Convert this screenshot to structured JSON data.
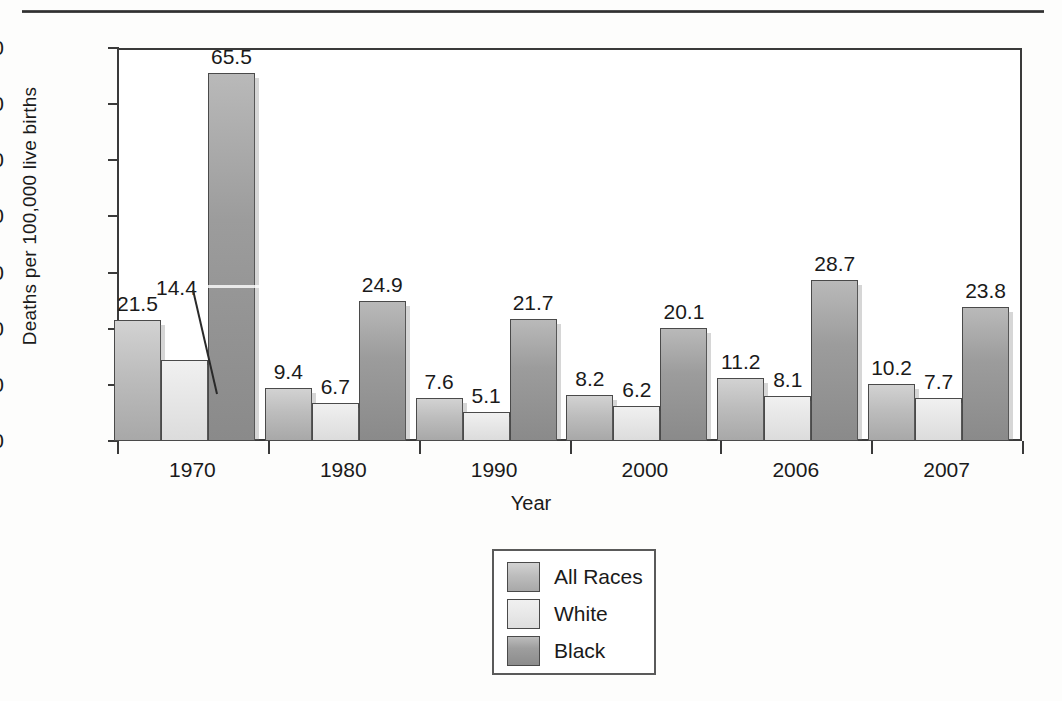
{
  "figure": {
    "top_rule": true,
    "axes": {
      "ylabel": "Deaths per 100,000 live births",
      "xlabel": "Year",
      "yticks": [
        "0",
        "10",
        "20",
        "30",
        "40",
        "50",
        "60",
        "70"
      ]
    }
  },
  "legend": {
    "entries": [
      {
        "label": "All Races",
        "swatch": "series-all"
      },
      {
        "label": "White",
        "swatch": "series-white"
      },
      {
        "label": "Black",
        "swatch": "series-black"
      }
    ]
  },
  "chart_data": {
    "type": "bar",
    "title": "",
    "xlabel": "Year",
    "ylabel": "Deaths per 100,000 live births",
    "categories": [
      "1970",
      "1980",
      "1990",
      "2000",
      "2006",
      "2007"
    ],
    "ylim": [
      0,
      70
    ],
    "ytick_step": 10,
    "grid": false,
    "legend_position": "bottom-center",
    "series": [
      {
        "name": "All Races",
        "values": [
          21.5,
          9.4,
          7.6,
          8.2,
          11.2,
          10.2
        ]
      },
      {
        "name": "White",
        "values": [
          14.4,
          6.7,
          5.1,
          6.2,
          8.1,
          7.7
        ]
      },
      {
        "name": "Black",
        "values": [
          65.5,
          24.9,
          21.7,
          20.1,
          28.7,
          23.8
        ]
      }
    ],
    "data_labels": {
      "1970": {
        "All Races": "21.5",
        "White": "14.4",
        "Black": "65.5"
      },
      "1980": {
        "All Races": "9.4",
        "White": "6.7",
        "Black": "24.9"
      },
      "1990": {
        "All Races": "7.6",
        "White": "5.1",
        "Black": "21.7"
      },
      "2000": {
        "All Races": "8.2",
        "White": "6.2",
        "Black": "20.1"
      },
      "2006": {
        "All Races": "11.2",
        "White": "8.1",
        "Black": "28.7"
      },
      "2007": {
        "All Races": "10.2",
        "White": "7.7",
        "Black": "23.8"
      }
    },
    "callouts": [
      {
        "category": "1970",
        "series": "White",
        "label": "14.4",
        "has_leader_line": true
      }
    ]
  },
  "colors": {
    "series_all_races": "#bdbdbd",
    "series_white": "#e6e6e6",
    "series_black": "#9c9c9c",
    "axis": "#3a3a3a",
    "text": "#1a1a1a",
    "background": "#ffffff"
  }
}
